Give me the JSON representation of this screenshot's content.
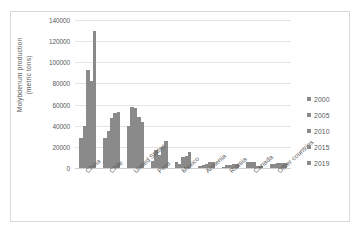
{
  "chart_data": {
    "type": "bar",
    "title": "",
    "xlabel": "",
    "ylabel": "Molybdenum production (metric tons)",
    "ylabel_lines": [
      "Molybdenum production",
      "(metric tons)"
    ],
    "ylim": [
      0,
      140000
    ],
    "ytick_values": [
      0,
      20000,
      40000,
      60000,
      80000,
      100000,
      120000,
      140000
    ],
    "ytick_labels": [
      "0",
      "20000",
      "40000",
      "60000",
      "80000",
      "100000",
      "120000",
      "140000"
    ],
    "grid": true,
    "legend_position": "right",
    "bar_color": "#8a8a8a",
    "categories": [
      "China",
      "Chile",
      "United States",
      "Peru",
      "Mexico",
      "Armenia",
      "Russia",
      "Canada",
      "Other countries"
    ],
    "series": [
      {
        "name": "2000",
        "values": [
          28000,
          28000,
          40000,
          7000,
          6000,
          2000,
          1000,
          5500,
          3500
        ]
      },
      {
        "name": "2005",
        "values": [
          40000,
          35000,
          58000,
          17000,
          4000,
          3000,
          2800,
          6000,
          4000
        ]
      },
      {
        "name": "2010",
        "values": [
          93000,
          47000,
          57000,
          12000,
          10000,
          4000,
          3000,
          6000,
          4500
        ]
      },
      {
        "name": "2015",
        "values": [
          82000,
          52000,
          48000,
          20000,
          11000,
          6000,
          3500,
          2000,
          5000
        ]
      },
      {
        "name": "2019",
        "values": [
          130000,
          53000,
          44000,
          26000,
          15000,
          6000,
          3500,
          2000,
          5000
        ]
      }
    ]
  },
  "legend": {
    "items": [
      {
        "label": "2000",
        "color": "#8a8a8a"
      },
      {
        "label": "2005",
        "color": "#8a8a8a"
      },
      {
        "label": "2010",
        "color": "#8a8a8a"
      },
      {
        "label": "2015",
        "color": "#8a8a8a"
      },
      {
        "label": "2019",
        "color": "#8a8a8a"
      }
    ]
  }
}
